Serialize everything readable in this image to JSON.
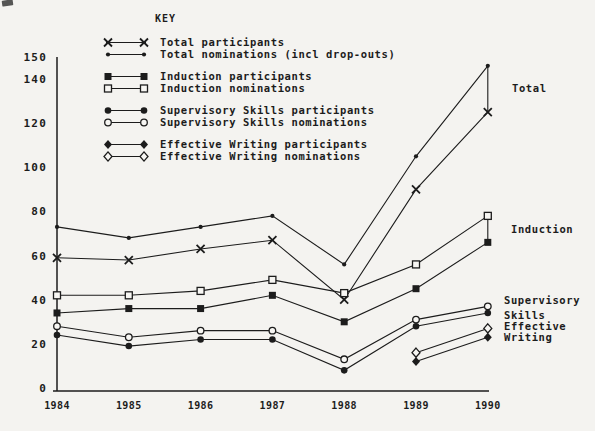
{
  "page": {
    "background": "#f4f3f0",
    "ink": "#1c1c1c",
    "marker_open_fill": "#f7f6f3"
  },
  "legend": {
    "title": "KEY",
    "groups": [
      [
        {
          "label": "Total participants",
          "marker": "x-cross"
        },
        {
          "label": "Total nominations (incl drop-outs)",
          "marker": "dot"
        }
      ],
      [
        {
          "label": "Induction participants",
          "marker": "square-filled"
        },
        {
          "label": "Induction nominations",
          "marker": "square-open"
        }
      ],
      [
        {
          "label": "Supervisory Skills participants",
          "marker": "circle-filled"
        },
        {
          "label": "Supervisory Skills nominations",
          "marker": "circle-open"
        }
      ],
      [
        {
          "label": "Effective Writing participants",
          "marker": "diamond-filled"
        },
        {
          "label": "Effective Writing nominations",
          "marker": "diamond-open"
        }
      ]
    ]
  },
  "chart_data": {
    "type": "line",
    "x": [
      1984,
      1985,
      1986,
      1987,
      1988,
      1989,
      1990
    ],
    "x_tick_labels": [
      "1984",
      "1985",
      "1986",
      "1987",
      "1988",
      "1989",
      "1990"
    ],
    "y_ticks": [
      0,
      20,
      40,
      60,
      80,
      100,
      120,
      140,
      150
    ],
    "ylim": [
      0,
      150
    ],
    "grid": false,
    "legend_position": "top-left",
    "series": [
      {
        "name": "Total nominations (incl drop-outs)",
        "marker": "dot",
        "values": [
          73,
          68,
          73,
          78,
          56,
          105,
          146
        ]
      },
      {
        "name": "Total participants",
        "marker": "x-cross",
        "values": [
          59,
          58,
          63,
          67,
          40,
          90,
          125
        ]
      },
      {
        "name": "Induction nominations",
        "marker": "square-open",
        "values": [
          42,
          42,
          44,
          49,
          43,
          56,
          78
        ]
      },
      {
        "name": "Induction participants",
        "marker": "square-filled",
        "values": [
          34,
          36,
          36,
          42,
          30,
          45,
          66
        ]
      },
      {
        "name": "Supervisory Skills nominations",
        "marker": "circle-open",
        "values": [
          28,
          23,
          26,
          26,
          13,
          31,
          37
        ]
      },
      {
        "name": "Supervisory Skills participants",
        "marker": "circle-filled",
        "values": [
          24,
          19,
          22,
          22,
          8,
          28,
          34
        ]
      },
      {
        "name": "Effective Writing nominations",
        "marker": "diamond-open",
        "values": [
          null,
          null,
          null,
          null,
          null,
          16,
          27
        ]
      },
      {
        "name": "Effective Writing participants",
        "marker": "diamond-filled",
        "values": [
          null,
          null,
          null,
          null,
          null,
          12,
          23
        ]
      }
    ],
    "end_connectors": [
      {
        "x": 1990,
        "between": [
          "Total nominations (incl drop-outs)",
          "Total participants"
        ]
      },
      {
        "x": 1990,
        "between": [
          "Induction nominations",
          "Induction participants"
        ]
      }
    ],
    "annotations": [
      {
        "lines": [
          "Total"
        ],
        "x": 512,
        "y": 88
      },
      {
        "lines": [
          "Induction"
        ],
        "x": 511,
        "y": 229
      },
      {
        "lines": [
          "Supervisory",
          "Skills"
        ],
        "x": 504,
        "y": 300,
        "lh": 15
      },
      {
        "lines": [
          "Effective",
          "Writing"
        ],
        "x": 504,
        "y": 326,
        "lh": 11
      }
    ]
  }
}
